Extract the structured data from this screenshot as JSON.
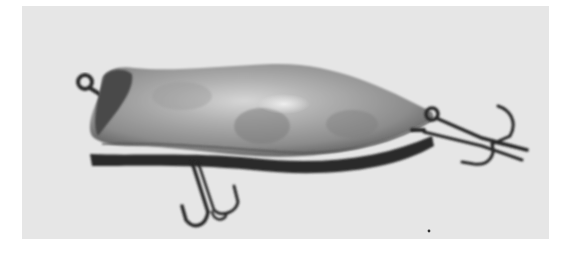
{
  "image": {
    "subject": "vintage fishing lure with two treble hooks",
    "style": "black-and-white photograph",
    "colors": {
      "background": "#e6e6e6",
      "page": "#ffffff",
      "body_light": "#b8b8b8",
      "body_mid": "#8a8a8a",
      "body_dark": "#3a3a3a",
      "metal": "#2a2a2a",
      "highlight": "#e8e8e8"
    }
  }
}
